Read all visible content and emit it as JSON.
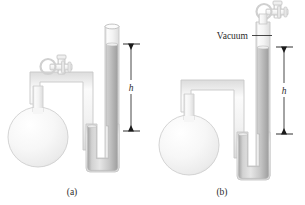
{
  "figure": {
    "type": "manometer-diagram",
    "panels": [
      {
        "id": "a",
        "caption": "(a)",
        "kind": "open-end-manometer",
        "height_label": "h",
        "tube_open_at_top": true,
        "has_valve": true,
        "annotation": ""
      },
      {
        "id": "b",
        "caption": "(b)",
        "kind": "closed-end-manometer",
        "height_label": "h",
        "tube_open_at_top": false,
        "has_valve": true,
        "annotation": "Vacuum"
      }
    ]
  },
  "colors": {
    "glass_outline": "#c9c9c9",
    "glass_fill": "#f2f2f2",
    "mercury_light": "#e3e3e3",
    "mercury_mid": "#c4c4c4",
    "mercury_dark": "#a9a9a9",
    "flask_fill": "#f4f4f4",
    "text": "#2b2b2b",
    "arrow": "#1a1a1a",
    "background": "#ffffff"
  },
  "icons": {
    "valve": "stopcock-valve-icon",
    "arrow_up": "arrow-up-icon",
    "arrow_down": "arrow-down-icon"
  }
}
